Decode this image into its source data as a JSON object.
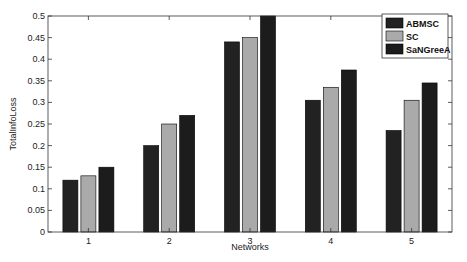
{
  "chart_data": {
    "type": "bar",
    "title": "",
    "xlabel": "Networks",
    "ylabel": "TotalInfoLoss",
    "categories": [
      "1",
      "2",
      "3",
      "4",
      "5"
    ],
    "series": [
      {
        "name": "ABMSC",
        "color": "#222222",
        "values": [
          0.12,
          0.2,
          0.44,
          0.305,
          0.235
        ]
      },
      {
        "name": "SC",
        "color": "#aaaaaa",
        "values": [
          0.13,
          0.25,
          0.45,
          0.335,
          0.305
        ]
      },
      {
        "name": "SaNGreeA",
        "color": "#1c1c1c",
        "values": [
          0.15,
          0.27,
          0.5,
          0.375,
          0.345
        ]
      }
    ],
    "ylim": [
      0,
      0.5
    ],
    "yticks": [
      "0",
      "0.05",
      "0.1",
      "0.15",
      "0.2",
      "0.25",
      "0.3",
      "0.35",
      "0.4",
      "0.45",
      "0.5"
    ],
    "grid": false,
    "legend_position": "top-right"
  }
}
